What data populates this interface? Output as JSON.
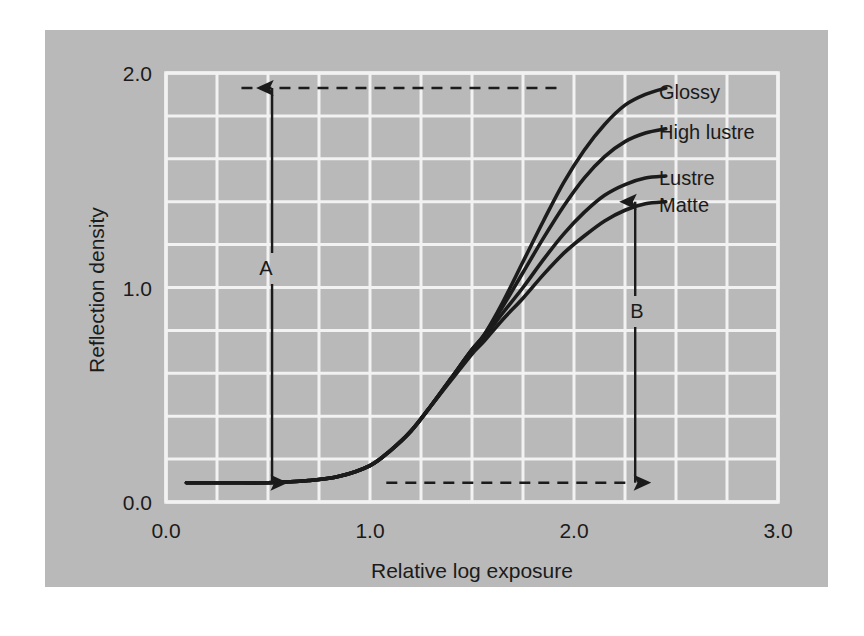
{
  "figure": {
    "panel_bg": "#b9b9b9",
    "page_bg": "#ffffff",
    "grid_color": "#f2f2f2",
    "ink_color": "#1b1b1b"
  },
  "chart_data": {
    "type": "line",
    "title": "",
    "xlabel": "Relative log exposure",
    "ylabel": "Reflection density",
    "xlim": [
      0.0,
      3.0
    ],
    "ylim": [
      0.0,
      2.0
    ],
    "xticks": [
      "0.0",
      "1.0",
      "2.0",
      "3.0"
    ],
    "xtick_values": [
      0.0,
      1.0,
      2.0,
      3.0
    ],
    "yticks": [
      "0.0",
      "1.0",
      "2.0"
    ],
    "ytick_values": [
      0.0,
      1.0,
      2.0
    ],
    "grid": true,
    "grid_x_step": 0.25,
    "grid_y_step": 0.2,
    "legend_position": "inline-right-of-curves",
    "base_density": 0.09,
    "x": [
      0.1,
      0.3,
      0.5,
      0.7,
      0.85,
      1.0,
      1.1,
      1.2,
      1.3,
      1.4,
      1.5,
      1.56,
      1.65,
      1.75,
      1.85,
      1.95,
      2.05,
      2.15,
      2.25,
      2.35,
      2.45
    ],
    "series": [
      {
        "name": "Glossy",
        "label": "Glossy",
        "values": [
          0.09,
          0.09,
          0.09,
          0.1,
          0.12,
          0.17,
          0.24,
          0.33,
          0.45,
          0.58,
          0.71,
          0.78,
          0.93,
          1.12,
          1.31,
          1.49,
          1.64,
          1.76,
          1.85,
          1.9,
          1.93
        ],
        "end_value": 1.93
      },
      {
        "name": "High lustre",
        "label": "High lustre",
        "values": [
          0.09,
          0.09,
          0.09,
          0.1,
          0.12,
          0.17,
          0.24,
          0.33,
          0.45,
          0.58,
          0.71,
          0.78,
          0.91,
          1.07,
          1.23,
          1.38,
          1.51,
          1.61,
          1.68,
          1.72,
          1.74
        ],
        "end_value": 1.74
      },
      {
        "name": "Lustre",
        "label": "Lustre",
        "values": [
          0.09,
          0.09,
          0.09,
          0.1,
          0.12,
          0.17,
          0.24,
          0.33,
          0.45,
          0.58,
          0.71,
          0.77,
          0.88,
          1.0,
          1.13,
          1.25,
          1.35,
          1.43,
          1.48,
          1.51,
          1.52
        ],
        "end_value": 1.52
      },
      {
        "name": "Matte",
        "label": "Matte",
        "values": [
          0.09,
          0.09,
          0.09,
          0.1,
          0.12,
          0.17,
          0.24,
          0.33,
          0.45,
          0.57,
          0.69,
          0.75,
          0.85,
          0.95,
          1.06,
          1.16,
          1.24,
          1.31,
          1.36,
          1.39,
          1.4
        ],
        "end_value": 1.4
      }
    ],
    "annotations": [
      {
        "label": "A",
        "kind": "double-arrow-vertical",
        "x": 0.52,
        "y_from": 0.09,
        "y_to": 1.93,
        "description": "total density scale of glossy paper"
      },
      {
        "label": "B",
        "kind": "double-arrow-vertical",
        "x": 2.3,
        "y_from": 0.09,
        "y_to": 1.4,
        "description": "total density scale of matte paper"
      }
    ],
    "reference_lines": [
      {
        "name": "dmax-glossy",
        "style": "dashed",
        "y": 1.93,
        "x_from": 0.37,
        "x_to": 1.93
      },
      {
        "name": "dmin-base",
        "style": "dashed",
        "y": 0.09,
        "x_from": 1.08,
        "x_to": 2.28
      }
    ]
  }
}
